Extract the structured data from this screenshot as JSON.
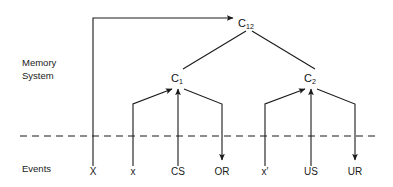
{
  "figure": {
    "title": "",
    "background_color": "#ffffff",
    "line_color": "#1a1a1a",
    "text_color": "#1a1a1a"
  },
  "regions": {
    "memory_system_label_line1": "Memory",
    "memory_system_label_line2": "System",
    "events_label": "Events"
  },
  "divider": {
    "style": "dashed",
    "y": 136
  },
  "nodes": {
    "c12": {
      "base": "C",
      "subscript": "12",
      "x": 246,
      "y": 22
    },
    "c1": {
      "base": "C",
      "subscript": "1",
      "x": 178,
      "y": 77
    },
    "c2": {
      "base": "C",
      "subscript": "2",
      "x": 311,
      "y": 77
    }
  },
  "events": [
    {
      "id": "event-X",
      "label": "X",
      "x": 93,
      "direction": "up-to-c12"
    },
    {
      "id": "event-x",
      "label": "x",
      "x": 133,
      "direction": "up-to-c1"
    },
    {
      "id": "event-CS",
      "label": "CS",
      "x": 178,
      "direction": "up-to-c1"
    },
    {
      "id": "event-OR",
      "label": "OR",
      "x": 222,
      "direction": "down-from-c1"
    },
    {
      "id": "event-xprime",
      "label": "x′",
      "x": 265,
      "direction": "up-to-c2"
    },
    {
      "id": "event-US",
      "label": "US",
      "x": 311,
      "direction": "up-to-c2"
    },
    {
      "id": "event-UR",
      "label": "UR",
      "x": 355,
      "direction": "down-from-c2"
    }
  ],
  "connections": [
    {
      "from": "event-X",
      "to": "c12",
      "type": "arrow"
    },
    {
      "from": "c12",
      "to": "c1",
      "type": "line"
    },
    {
      "from": "c12",
      "to": "c2",
      "type": "line"
    },
    {
      "from": "event-x",
      "to": "c1",
      "type": "arrow"
    },
    {
      "from": "event-CS",
      "to": "c1",
      "type": "arrow"
    },
    {
      "from": "c1",
      "to": "event-OR",
      "type": "arrow"
    },
    {
      "from": "event-xprime",
      "to": "c2",
      "type": "arrow"
    },
    {
      "from": "event-US",
      "to": "c2",
      "type": "arrow"
    },
    {
      "from": "c2",
      "to": "event-UR",
      "type": "arrow"
    }
  ]
}
